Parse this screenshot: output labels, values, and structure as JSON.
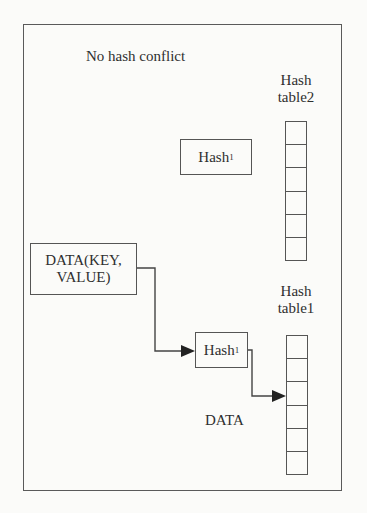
{
  "diagram": {
    "title": "No hash conflict",
    "hash_table2": {
      "label_line1": "Hash",
      "label_line2": "table2",
      "cells": [
        "",
        "",
        "",
        "",
        "",
        ""
      ]
    },
    "hash_table1": {
      "label_line1": "Hash",
      "label_line2": "table1",
      "cells": [
        "",
        "",
        "",
        "",
        "",
        ""
      ]
    },
    "hash_box_upper": {
      "label": "Hash",
      "subscript": "1"
    },
    "hash_box_lower": {
      "label": "Hash",
      "subscript": "1"
    },
    "data_box": {
      "line1": "DATA(KEY,",
      "line2": "VALUE)"
    },
    "data_label": "DATA",
    "colors": {
      "stroke": "#555555",
      "text": "#2f2f2f",
      "background": "#fbfbf9"
    },
    "edges": [
      {
        "from": "data_box",
        "to": "hash_box_lower",
        "arrow": true
      },
      {
        "from": "hash_box_lower",
        "to": "hash_table1.cell_3",
        "arrow": true
      }
    ]
  }
}
